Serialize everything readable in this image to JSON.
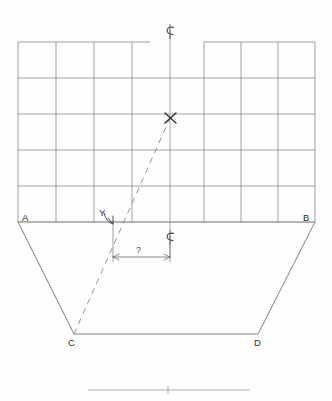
{
  "drawing": {
    "title": "hand-drawn structural elevation sketch",
    "type": "engineering-sketch",
    "background_color": "#fefefe",
    "line_color": "#6b6b6b",
    "heavy_line_color": "#4a4a4a",
    "text_color": "#2e2e2e",
    "dimension_color": "#555555"
  },
  "grid": {
    "description": "rectangular panel grid above the trapezoid",
    "left_px": 18,
    "right_px": 315,
    "top_px": 42,
    "bottom_px": 222,
    "columns": 8,
    "rows": 5,
    "vertical_x": [
      18,
      56,
      94,
      132,
      170,
      204,
      241,
      278,
      315
    ],
    "horizontal_y": [
      42,
      78,
      114,
      150,
      186,
      222
    ],
    "top_edge_gap": {
      "from_x": 150,
      "to_x": 204,
      "note": "break in the top outline at the centerline"
    }
  },
  "centerline": {
    "x_px": 170,
    "top_y_px": 30,
    "bottom_y_px": 258,
    "symbol": "centerline-symbol",
    "symbol_text": "℄"
  },
  "points": {
    "x_point": {
      "label": "X",
      "x_px": 170,
      "y_px": 118,
      "marker": "x-cross-marker"
    },
    "y_point": {
      "label": "Y",
      "x_px": 113,
      "y_px": 222,
      "label_x_px": 100,
      "label_y_px": 212,
      "marker": "y-arrow-marker"
    }
  },
  "corners": [
    {
      "label": "A",
      "x_px": 18,
      "y_px": 222,
      "label_x_px": 22,
      "label_y_px": 216
    },
    {
      "label": "B",
      "x_px": 315,
      "y_px": 222,
      "label_x_px": 303,
      "label_y_px": 216
    },
    {
      "label": "C",
      "x_px": 74,
      "y_px": 334,
      "label_x_px": 68,
      "label_y_px": 338
    },
    {
      "label": "D",
      "x_px": 258,
      "y_px": 334,
      "label_x_px": 254,
      "label_y_px": 338
    }
  ],
  "trapezoid": {
    "description": "splayed base outline A-C-D-B",
    "vertices": "18,222 74,334 258,334 315,222"
  },
  "dimension": {
    "label": "?",
    "value_text": "?",
    "from_x_px": 113,
    "to_x_px": 170,
    "line_y_px": 257,
    "label_x_px": 136,
    "label_y_px": 249,
    "extension_left_top_y_px": 222,
    "extension_right_top_y_px": 236,
    "arrow_style": "double-arrow",
    "centerline_symbol_text": "℄",
    "centerline_symbol_x_px": 164,
    "centerline_symbol_y_px": 232
  },
  "dashed_line": {
    "description": "dashed construction line from C through Y to X",
    "from": "C",
    "through": "Y",
    "to": "X",
    "from_x_px": 74,
    "from_y_px": 334,
    "to_x_px": 170,
    "to_y_px": 118,
    "dash_pattern": "6 5"
  },
  "scale_bar": {
    "description": "horizontal scale / reference bar at bottom with center tick",
    "left_x_px": 88,
    "right_x_px": 250,
    "y_px": 390,
    "tick_x_px": 168,
    "tick_half_height_px": 4
  }
}
